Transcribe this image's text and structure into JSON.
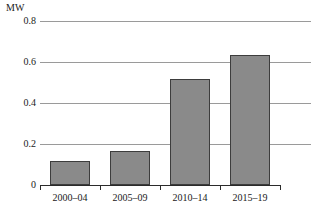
{
  "chart_data": {
    "type": "bar",
    "title": "",
    "subtitle": "",
    "xlabel": "",
    "ylabel": "MW",
    "unit_caption": "MW",
    "categories": [
      "2000–04",
      "2005–09",
      "2010–14",
      "2015–19"
    ],
    "values": [
      0.115,
      0.165,
      0.515,
      0.635
    ],
    "series": [
      {
        "name": "Capacity",
        "values": [
          0.115,
          0.165,
          0.515,
          0.635
        ]
      }
    ],
    "ylim": [
      0,
      0.8
    ],
    "ytick_values": [
      0,
      0.2,
      0.4,
      0.6,
      0.8
    ],
    "ytick_labels": [
      "0",
      "0.2",
      "0.4",
      "0.6",
      "0.8"
    ],
    "grid": true,
    "grid_axis": "y",
    "legend": false,
    "legend_position": "none",
    "annotations": [],
    "colors": {
      "bar_fill": "#8a8a8a",
      "bar_border": "#3d3d3d",
      "gridline": "#9a9a9a",
      "axis": "#2b2b2b",
      "text": "#1a1a1a",
      "background": "#ffffff"
    }
  }
}
